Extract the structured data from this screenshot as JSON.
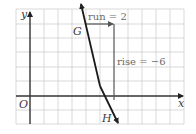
{
  "diagram": {
    "type": "coordinate-grid-line-slope",
    "axes": {
      "x_label": "x",
      "y_label": "y",
      "origin_label": "O"
    },
    "grid": {
      "columns": 12,
      "rows": 8,
      "line_color": "#c8c8c8",
      "axis_color": "#333333"
    },
    "points": [
      {
        "label": "G"
      },
      {
        "label": "H"
      }
    ],
    "annotations": {
      "run": "run = 2",
      "rise": "rise = −6"
    },
    "colors": {
      "line": "#1a1a1a",
      "run_rise": "#555555",
      "background": "#ffffff"
    }
  }
}
